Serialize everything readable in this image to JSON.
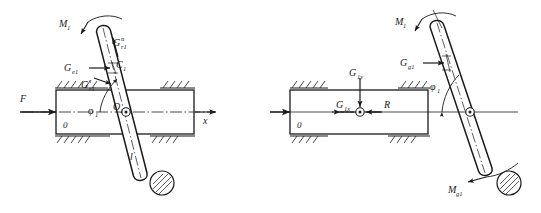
{
  "figure": {
    "type": "mechanical-free-body-diagram",
    "panel_count": 2,
    "stroke_color": "#1a1a1a",
    "fill_color": "#ffffff"
  },
  "left_panel": {
    "name": "left-diagram",
    "description": "Slider block with inclined rod, inertia force components",
    "labels": {
      "applied_force": "F",
      "moment": "M",
      "moment_sub": "1",
      "normal_force": "G",
      "normal_force_sub": "r1",
      "normal_force_sup": "n",
      "tangential_force": "G",
      "tangential_force_sub": "r1",
      "tangential_force_sup": "τ",
      "centrifugal_force": "G",
      "centrifugal_force_sub": "e1",
      "center_point": "C",
      "center_point_sub": "1",
      "pivot_point": "O",
      "pivot_point_sub": "1",
      "angle": "φ",
      "angle_sub": "1",
      "axis": "x",
      "ground_label": "0",
      "length": "l"
    }
  },
  "right_panel": {
    "name": "right-diagram",
    "description": "Slider block with reaction forces and inertia moment on rod",
    "labels": {
      "applied_force": "F",
      "moment": "M",
      "moment_sub": "1",
      "inertia_moment": "M",
      "inertia_moment_sub": "g1",
      "gravity_force": "G",
      "gravity_force_sub": "g1",
      "vertical_component": "G",
      "vertical_component_sub": "1y",
      "horizontal_component": "G",
      "horizontal_component_sub": "1x",
      "reaction": "R",
      "angle": "φ",
      "angle_sub": "1",
      "ground_label": "0"
    }
  }
}
